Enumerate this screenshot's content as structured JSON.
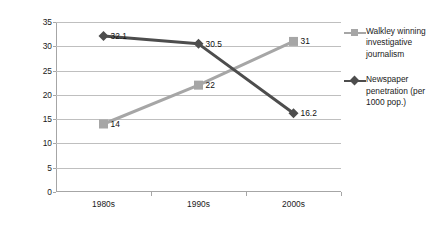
{
  "chart_data": {
    "type": "line",
    "title": "",
    "xlabel": "",
    "ylabel": "Newspaper penetration (x10)",
    "categories": [
      "1980s",
      "1990s",
      "2000s"
    ],
    "ylim": [
      0,
      35
    ],
    "yticks": [
      0,
      5,
      10,
      15,
      20,
      25,
      30,
      35
    ],
    "grid": "horizontal",
    "legend_position": "right",
    "series": [
      {
        "name": "Walkley winning investigative journalism",
        "values": [
          14,
          22,
          31
        ],
        "labels": [
          "14",
          "22",
          "31"
        ],
        "color": "#a6a6a6",
        "marker": "square"
      },
      {
        "name": "Newspaper penetration (per 1000 pop.)",
        "values": [
          32.1,
          30.5,
          16.2
        ],
        "labels": [
          "32.1",
          "30.5",
          "16.2"
        ],
        "color": "#4d4d4d",
        "marker": "diamond"
      }
    ]
  },
  "axis": {
    "y_title": "Newspaper penetration (x10)",
    "y_tick_labels": [
      "35",
      "30",
      "25",
      "20",
      "15",
      "10",
      "5",
      "0"
    ],
    "x_tick_labels": [
      "1980s",
      "1990s",
      "2000s"
    ]
  },
  "legend": {
    "items": [
      {
        "label": "Walkley winning investigative journalism",
        "marker": "square",
        "color": "#a6a6a6"
      },
      {
        "label": "Newspaper penetration (per 1000 pop.)",
        "marker": "diamond",
        "color": "#4d4d4d"
      }
    ]
  },
  "colors": {
    "walkley": "#a6a6a6",
    "newspaper": "#4d4d4d",
    "gridline": "#bfbfbf",
    "axis": "#a6a6a6",
    "background": "#ffffff"
  }
}
